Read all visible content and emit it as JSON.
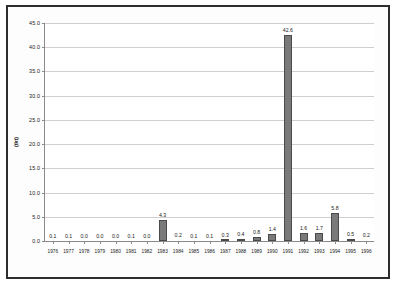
{
  "chart_data": {
    "type": "bar",
    "title": "",
    "xlabel": "",
    "ylabel": "(tkt)",
    "ylim": [
      0.0,
      45.0
    ],
    "yticks": [
      "0.0",
      "5.0",
      "10.0",
      "15.0",
      "20.0",
      "25.0",
      "30.0",
      "35.0",
      "40.0",
      "45.0"
    ],
    "grid": true,
    "legend": false,
    "categories": [
      "1976",
      "1977",
      "1978",
      "1979",
      "1980",
      "1981",
      "1982",
      "1983",
      "1984",
      "1985",
      "1986",
      "1987",
      "1988",
      "1989",
      "1990",
      "1991",
      "1992",
      "1993",
      "1994",
      "1995",
      "1996"
    ],
    "values": [
      0.1,
      0.1,
      0.0,
      0.0,
      0.0,
      0.1,
      0.0,
      4.3,
      0.2,
      0.1,
      0.1,
      0.3,
      0.4,
      0.8,
      1.4,
      42.6,
      1.6,
      1.7,
      5.8,
      0.5,
      0.2
    ],
    "value_labels": [
      "0.1",
      "0.1",
      "0.0",
      "0.0",
      "0.0",
      "0.1",
      "0.0",
      "4.3",
      "0.2",
      "0.1",
      "0.1",
      "0.3",
      "0.4",
      "0.8",
      "1.4",
      "42.6",
      "1.6",
      "1.7",
      "5.8",
      "0.5",
      "0.2"
    ],
    "bar_color": "#7a7a7a",
    "bar_edge_color": "#4a4a4a",
    "grid_color": "#cfcfcf",
    "axis_color": "#8a8a8a",
    "frame_color": "#2e2e2e",
    "background": "#ffffff"
  }
}
